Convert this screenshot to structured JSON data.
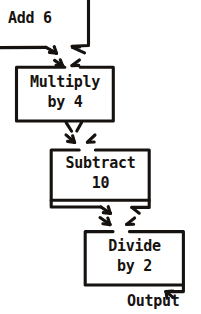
{
  "diagram": {
    "ink_color": "#16120f",
    "background_color": "#ffffff",
    "style": "hand-drawn",
    "nodes": [
      {
        "id": "add",
        "label": "Add 6",
        "line1": "Add 6",
        "line2": "",
        "kind": "process",
        "box_visible": false,
        "note": "box cropped off top of image"
      },
      {
        "id": "multiply",
        "label": "Multiply by 4",
        "line1": "Multiply",
        "line2": "by 4",
        "kind": "process",
        "box_visible": true
      },
      {
        "id": "subtract",
        "label": "Subtract 10",
        "line1": "Subtract",
        "line2": "10",
        "kind": "process",
        "box_visible": true
      },
      {
        "id": "divide",
        "label": "Divide by 2",
        "line1": "Divide",
        "line2": "by 2",
        "kind": "process",
        "box_visible": true
      }
    ],
    "terminal": {
      "id": "output",
      "label": "Output"
    },
    "edges": [
      {
        "from": "add",
        "to": "multiply"
      },
      {
        "from": "multiply",
        "to": "subtract"
      },
      {
        "from": "subtract",
        "to": "divide"
      },
      {
        "from": "divide",
        "to": "output"
      }
    ]
  }
}
